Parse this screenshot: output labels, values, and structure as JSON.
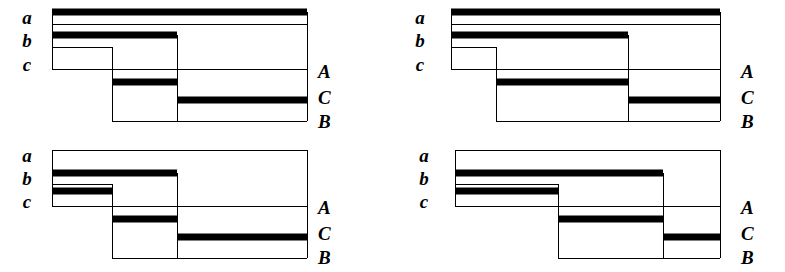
{
  "figure": {
    "background_color": "#ffffff",
    "line_color": "#000000",
    "fill_color": "#ffffff",
    "marker_color": "#000000",
    "thin_line_width": 1,
    "thick_bar_height": 7,
    "panel_count": 4
  },
  "panels": [
    {
      "id": "panel-top-left",
      "x": 0,
      "y": 0,
      "width": 392,
      "height": 136,
      "left_labels": [
        {
          "text": "a",
          "x": 18,
          "y": 8
        },
        {
          "text": "b",
          "x": 18,
          "y": 31
        },
        {
          "text": "c",
          "x": 18,
          "y": 55
        }
      ],
      "right_labels": [
        {
          "text": "A",
          "x": 318,
          "y": 62
        },
        {
          "text": "C",
          "x": 318,
          "y": 88
        },
        {
          "text": "B",
          "x": 318,
          "y": 112
        }
      ],
      "geometry": {
        "left": 52,
        "right": 307,
        "step1_x": 112,
        "step2_x": 177,
        "top_y": 12,
        "horizons": [
          {
            "name": "a-top",
            "y": 12,
            "from": "left",
            "to": "right",
            "thick": true
          },
          {
            "name": "a-base",
            "y": 24,
            "from": "left",
            "to": "right",
            "thick": false
          },
          {
            "name": "b-top",
            "y": 35,
            "from": "left",
            "to": "step2",
            "thick": true
          },
          {
            "name": "b-base",
            "y": 47,
            "from": "left",
            "to": "step1",
            "thick": false
          },
          {
            "name": "c-base",
            "y": 69,
            "from": "left",
            "to": "right",
            "thick": false
          },
          {
            "name": "A-mark",
            "y": 82,
            "from": "step1",
            "to": "step2",
            "thick": true
          },
          {
            "name": "C-mark",
            "y": 100,
            "from": "step2",
            "to": "right",
            "thick": true
          },
          {
            "name": "B-base",
            "y": 121,
            "from": "step1",
            "to": "right",
            "thick": false
          }
        ],
        "verticals": [
          {
            "name": "left-edge",
            "x": 52,
            "from": 12,
            "to": 69
          },
          {
            "name": "step1-edge",
            "x": 112,
            "from": 47,
            "to": 121
          },
          {
            "name": "step2-edge",
            "x": 177,
            "from": 35,
            "to": 121
          },
          {
            "name": "right-edge",
            "x": 307,
            "from": 12,
            "to": 121
          }
        ]
      }
    },
    {
      "id": "panel-top-right",
      "x": 393,
      "y": 0,
      "width": 392,
      "height": 136,
      "left_labels": [
        {
          "text": "a",
          "x": 18,
          "y": 8
        },
        {
          "text": "b",
          "x": 18,
          "y": 31
        },
        {
          "text": "c",
          "x": 18,
          "y": 55
        }
      ],
      "right_labels": [
        {
          "text": "A",
          "x": 348,
          "y": 62
        },
        {
          "text": "C",
          "x": 348,
          "y": 88
        },
        {
          "text": "B",
          "x": 348,
          "y": 112
        }
      ],
      "geometry": {
        "left": 58,
        "right": 327,
        "step1_x": 103,
        "step2_x": 235,
        "top_y": 12,
        "horizons": [
          {
            "name": "a-top",
            "y": 12,
            "from": "left",
            "to": "right",
            "thick": true
          },
          {
            "name": "a-base",
            "y": 24,
            "from": "left",
            "to": "right",
            "thick": false
          },
          {
            "name": "b-top",
            "y": 35,
            "from": "left",
            "to": "step2",
            "thick": true
          },
          {
            "name": "b-base",
            "y": 47,
            "from": "left",
            "to": "step1",
            "thick": false
          },
          {
            "name": "c-base",
            "y": 69,
            "from": "left",
            "to": "right",
            "thick": false
          },
          {
            "name": "A-mark",
            "y": 82,
            "from": "step1",
            "to": "step2",
            "thick": true
          },
          {
            "name": "C-mark",
            "y": 100,
            "from": "step2",
            "to": "right",
            "thick": true
          },
          {
            "name": "B-base",
            "y": 121,
            "from": "step1",
            "to": "right",
            "thick": false
          }
        ],
        "verticals": [
          {
            "name": "left-edge",
            "x": 58,
            "from": 12,
            "to": 69
          },
          {
            "name": "step1-edge",
            "x": 103,
            "from": 47,
            "to": 121
          },
          {
            "name": "step2-edge",
            "x": 235,
            "from": 35,
            "to": 121
          },
          {
            "name": "right-edge",
            "x": 327,
            "from": 12,
            "to": 121
          }
        ]
      }
    },
    {
      "id": "panel-bottom-left",
      "x": 0,
      "y": 136,
      "width": 392,
      "height": 136,
      "left_labels": [
        {
          "text": "a",
          "x": 18,
          "y": 10
        },
        {
          "text": "b",
          "x": 18,
          "y": 33
        },
        {
          "text": "c",
          "x": 18,
          "y": 56
        }
      ],
      "right_labels": [
        {
          "text": "A",
          "x": 318,
          "y": 62
        },
        {
          "text": "C",
          "x": 318,
          "y": 88
        },
        {
          "text": "B",
          "x": 318,
          "y": 112
        }
      ],
      "geometry": {
        "left": 52,
        "right": 307,
        "step1_x": 112,
        "step2_x": 177,
        "top_y": 14,
        "horizons": [
          {
            "name": "a-top",
            "y": 14,
            "from": "left",
            "to": "right",
            "thick": false
          },
          {
            "name": "b-top",
            "y": 37,
            "from": "left",
            "to": "step2",
            "thick": true
          },
          {
            "name": "b-base",
            "y": 48,
            "from": "left",
            "to": "step1",
            "thick": false
          },
          {
            "name": "c-top",
            "y": 55,
            "from": "left",
            "to": "step1",
            "thick": true
          },
          {
            "name": "c-base",
            "y": 70,
            "from": "left",
            "to": "right",
            "thick": false
          },
          {
            "name": "A-mark",
            "y": 83,
            "from": "step1",
            "to": "step2",
            "thick": true
          },
          {
            "name": "C-mark",
            "y": 101,
            "from": "step2",
            "to": "right",
            "thick": true
          },
          {
            "name": "B-base",
            "y": 122,
            "from": "step1",
            "to": "right",
            "thick": false
          }
        ],
        "verticals": [
          {
            "name": "left-edge",
            "x": 52,
            "from": 14,
            "to": 70
          },
          {
            "name": "step1-edge",
            "x": 112,
            "from": 48,
            "to": 122
          },
          {
            "name": "step2-edge",
            "x": 177,
            "from": 37,
            "to": 122
          },
          {
            "name": "right-edge",
            "x": 307,
            "from": 14,
            "to": 122
          }
        ]
      }
    },
    {
      "id": "panel-bottom-right",
      "x": 393,
      "y": 136,
      "width": 392,
      "height": 136,
      "left_labels": [
        {
          "text": "a",
          "x": 22,
          "y": 10
        },
        {
          "text": "b",
          "x": 22,
          "y": 33
        },
        {
          "text": "c",
          "x": 22,
          "y": 56
        }
      ],
      "right_labels": [
        {
          "text": "A",
          "x": 348,
          "y": 62
        },
        {
          "text": "C",
          "x": 348,
          "y": 88
        },
        {
          "text": "B",
          "x": 348,
          "y": 112
        }
      ],
      "geometry": {
        "left": 62,
        "right": 327,
        "step1_x": 165,
        "step2_x": 270,
        "top_y": 14,
        "horizons": [
          {
            "name": "a-top",
            "y": 14,
            "from": "left",
            "to": "right",
            "thick": false
          },
          {
            "name": "b-top",
            "y": 37,
            "from": "left",
            "to": "step2",
            "thick": true
          },
          {
            "name": "b-base",
            "y": 48,
            "from": "left",
            "to": "step1",
            "thick": false
          },
          {
            "name": "c-top",
            "y": 55,
            "from": "left",
            "to": "step1",
            "thick": true
          },
          {
            "name": "c-base",
            "y": 70,
            "from": "left",
            "to": "right",
            "thick": false
          },
          {
            "name": "A-mark",
            "y": 83,
            "from": "step1",
            "to": "step2",
            "thick": true
          },
          {
            "name": "C-mark",
            "y": 101,
            "from": "step2",
            "to": "right",
            "thick": true
          },
          {
            "name": "B-base",
            "y": 122,
            "from": "step1",
            "to": "right",
            "thick": false
          }
        ],
        "verticals": [
          {
            "name": "left-edge",
            "x": 62,
            "from": 14,
            "to": 70
          },
          {
            "name": "step1-edge",
            "x": 165,
            "from": 48,
            "to": 122
          },
          {
            "name": "step2-edge",
            "x": 270,
            "from": 37,
            "to": 122
          },
          {
            "name": "right-edge",
            "x": 327,
            "from": 14,
            "to": 122
          }
        ]
      }
    }
  ]
}
